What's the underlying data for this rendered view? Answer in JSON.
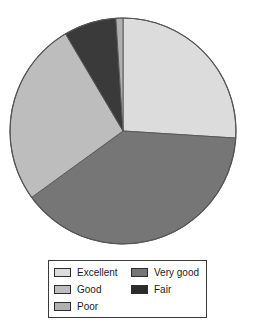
{
  "chart_data": {
    "type": "pie",
    "title": "",
    "categories": [
      "Excellent",
      "Very good",
      "Good",
      "Fair",
      "Poor"
    ],
    "values": [
      26,
      39,
      26.5,
      7.5,
      1
    ],
    "unit": "percent",
    "start_angle_deg": 0,
    "direction": "clockwise",
    "slices": [
      {
        "label": "Excellent",
        "value": 26,
        "color": "#dcdcdc",
        "start_deg": 0,
        "end_deg": 93.6
      },
      {
        "label": "Very good",
        "value": 39,
        "color": "#767676",
        "start_deg": 93.6,
        "end_deg": 234.0
      },
      {
        "label": "Good",
        "value": 26.5,
        "color": "#bdbdbd",
        "start_deg": 234.0,
        "end_deg": 329.4
      },
      {
        "label": "Fair",
        "value": 7.5,
        "color": "#3a3a3a",
        "start_deg": 329.4,
        "end_deg": 356.4
      },
      {
        "label": "Poor",
        "value": 1,
        "color": "#b0b0b0",
        "start_deg": 356.4,
        "end_deg": 360.0
      }
    ],
    "legend": {
      "position": "bottom",
      "columns": 2,
      "border_color": "#3b3b3b",
      "column_left": [
        {
          "label": "Excellent",
          "color": "#dcdcdc"
        },
        {
          "label": "Good",
          "color": "#bdbdbd"
        },
        {
          "label": "Poor",
          "color": "#b0b0b0"
        }
      ],
      "column_right": [
        {
          "label": "Very good",
          "color": "#767676"
        },
        {
          "label": "Fair",
          "color": "#2b2b2b"
        }
      ]
    },
    "geometry": {
      "center_x": 123,
      "center_y": 131,
      "radius": 113
    },
    "outline_color": "#555555"
  }
}
